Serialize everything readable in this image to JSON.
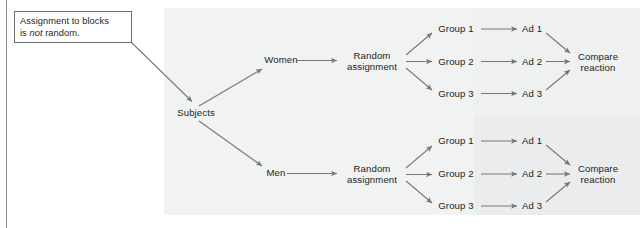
{
  "figure": {
    "type": "flow-diagram"
  },
  "callout": {
    "name": "assignment-note",
    "line1_before": "Assignment to blocks",
    "line2_before": "is ",
    "line2_emphasis": "not",
    "line2_after": " random."
  },
  "nodes": {
    "subjects": "Subjects",
    "block_women": "Women",
    "block_men": "Men",
    "random_assignment_line1": "Random",
    "random_assignment_line2": "assignment",
    "group1": "Group 1",
    "group2": "Group 2",
    "group3": "Group 3",
    "ad1": "Ad 1",
    "ad2": "Ad 2",
    "ad3": "Ad 3",
    "compare_line1": "Compare",
    "compare_line2": "reaction"
  },
  "colors": {
    "panel_background": "#eff0f0",
    "page_background": "#ffffff",
    "text": "#231f20",
    "arrow": "#76777a",
    "callout_border": "#6d6d6d",
    "rule": "#8c8c8c"
  },
  "branches": [
    {
      "block": "Women",
      "groups": [
        "Group 1",
        "Group 2",
        "Group 3"
      ],
      "treatments": [
        "Ad 1",
        "Ad 2",
        "Ad 3"
      ],
      "outcome": "Compare reaction"
    },
    {
      "block": "Men",
      "groups": [
        "Group 1",
        "Group 2",
        "Group 3"
      ],
      "treatments": [
        "Ad 1",
        "Ad 2",
        "Ad 3"
      ],
      "outcome": "Compare reaction"
    }
  ]
}
